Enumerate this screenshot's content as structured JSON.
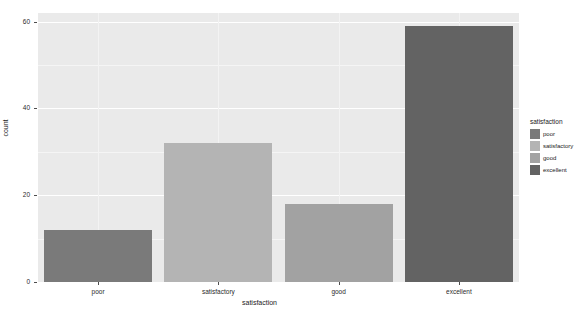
{
  "chart_data": {
    "type": "bar",
    "title": "",
    "subtitle": "",
    "xlabel": "satisfaction",
    "ylabel": "count",
    "categories": [
      "poor",
      "satisfactory",
      "good",
      "excellent"
    ],
    "values": [
      12,
      32,
      18,
      59
    ],
    "series": [
      {
        "name": "satisfaction",
        "values": [
          12,
          32,
          18,
          59
        ]
      }
    ],
    "ylim": [
      0,
      62
    ],
    "yticks": [
      0,
      20,
      40,
      60
    ],
    "ytick_labels": [
      "0",
      "20",
      "40",
      "60"
    ],
    "xtick_labels": [
      "poor",
      "satisfactory",
      "good",
      "excellent"
    ],
    "grid": true,
    "grid_color": "#ffffff",
    "panel_background": "#eaeaea",
    "legend_position": "right",
    "legend": {
      "title": "satisfaction",
      "entries": [
        {
          "label": "poor",
          "color": "#7a7a7a"
        },
        {
          "label": "satisfactory",
          "color": "#b4b4b4"
        },
        {
          "label": "good",
          "color": "#a2a2a2"
        },
        {
          "label": "excellent",
          "color": "#636363"
        }
      ]
    },
    "bar_colors": [
      "#7a7a7a",
      "#b4b4b4",
      "#a2a2a2",
      "#636363"
    ]
  }
}
